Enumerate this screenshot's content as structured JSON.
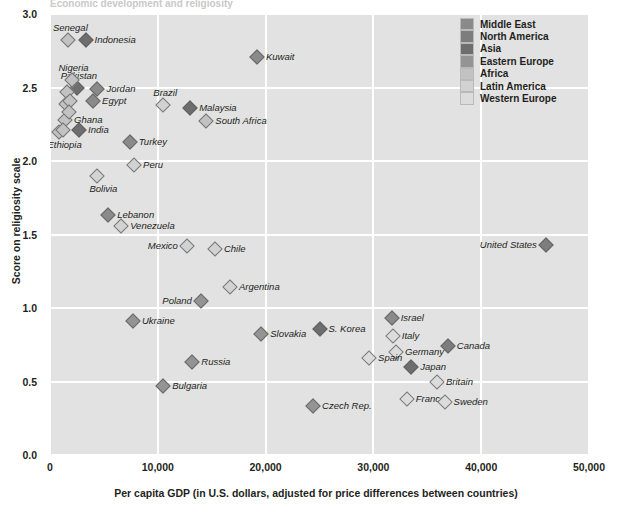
{
  "title": "Economic development and religiosity",
  "axes": {
    "xlabel": "Per capita GDP (in U.S. dollars, adjusted for price differences between countries)",
    "ylabel": "Score on religiosity scale",
    "xticks": [
      "0",
      "10,000",
      "20,000",
      "30,000",
      "40,000",
      "50,000"
    ],
    "yticks": [
      "3.0",
      "2.5",
      "2.0",
      "1.5",
      "1.0",
      "0.5",
      "0.0"
    ]
  },
  "legend": {
    "entries": [
      {
        "label": "Middle East",
        "color": "#8a8a8a"
      },
      {
        "label": "North America",
        "color": "#7d7d7d"
      },
      {
        "label": "Asia",
        "color": "#6e6e6e"
      },
      {
        "label": "Eastern Europe",
        "color": "#949494"
      },
      {
        "label": "Africa",
        "color": "#c2c2c2"
      },
      {
        "label": "Latin America",
        "color": "#d2d2d2"
      },
      {
        "label": "Western Europe",
        "color": "#dcdcdc"
      }
    ]
  },
  "chart_data": {
    "type": "scatter",
    "title": "Economic development and religiosity",
    "xlabel": "Per capita GDP (in U.S. dollars, adjusted for price differences between countries)",
    "ylabel": "Score on religiosity scale",
    "xlim": [
      0,
      50000
    ],
    "ylim": [
      0.0,
      3.0
    ],
    "grid": true,
    "legend_position": "top-right",
    "series": [
      {
        "name": "Middle East",
        "color": "#8a8a8a",
        "points": [
          {
            "label": "Kuwait",
            "x": 19200,
            "y": 2.71,
            "side": "r"
          },
          {
            "label": "Jordan",
            "x": 4400,
            "y": 2.49,
            "side": "r"
          },
          {
            "label": "Egypt",
            "x": 4000,
            "y": 2.41,
            "side": "r"
          },
          {
            "label": "Turkey",
            "x": 7400,
            "y": 2.13,
            "side": "r"
          },
          {
            "label": "Lebanon",
            "x": 5400,
            "y": 1.63,
            "side": "r"
          },
          {
            "label": "Israel",
            "x": 31700,
            "y": 0.93,
            "side": "r"
          }
        ]
      },
      {
        "name": "North America",
        "color": "#7d7d7d",
        "points": [
          {
            "label": "United States",
            "x": 46000,
            "y": 1.43,
            "side": "l"
          },
          {
            "label": "Canada",
            "x": 36900,
            "y": 0.74,
            "side": "r"
          }
        ]
      },
      {
        "name": "Asia",
        "color": "#6e6e6e",
        "points": [
          {
            "label": "Indonesia",
            "x": 3300,
            "y": 2.82,
            "side": "r"
          },
          {
            "label": "Pakistan",
            "x": 2500,
            "y": 2.5,
            "side": "t"
          },
          {
            "label": "India",
            "x": 2700,
            "y": 2.21,
            "side": "r"
          },
          {
            "label": "Malaysia",
            "x": 13000,
            "y": 2.36,
            "side": "r"
          },
          {
            "label": "S. Korea",
            "x": 25000,
            "y": 0.86,
            "side": "r"
          },
          {
            "label": "Japan",
            "x": 33500,
            "y": 0.6,
            "side": "r"
          }
        ]
      },
      {
        "name": "Eastern Europe",
        "color": "#949494",
        "points": [
          {
            "label": "Poland",
            "x": 14000,
            "y": 1.05,
            "side": "l"
          },
          {
            "label": "Ukraine",
            "x": 7700,
            "y": 0.91,
            "side": "r"
          },
          {
            "label": "Slovakia",
            "x": 19600,
            "y": 0.82,
            "side": "r"
          },
          {
            "label": "Russia",
            "x": 13200,
            "y": 0.63,
            "side": "r"
          },
          {
            "label": "Bulgaria",
            "x": 10500,
            "y": 0.47,
            "side": "r"
          },
          {
            "label": "Czech Rep.",
            "x": 24400,
            "y": 0.33,
            "side": "r"
          }
        ]
      },
      {
        "name": "Africa",
        "color": "#c2c2c2",
        "points": [
          {
            "label": "Senegal",
            "x": 1700,
            "y": 2.82,
            "side": "t"
          },
          {
            "label": "Nigeria",
            "x": 2000,
            "y": 2.55,
            "side": "t"
          },
          {
            "label": "Ghana",
            "x": 1400,
            "y": 2.28,
            "side": "r"
          },
          {
            "label": "Ethiopia",
            "x": 800,
            "y": 2.2,
            "side": "b"
          },
          {
            "label": "South Africa",
            "x": 14500,
            "y": 2.27,
            "side": "r"
          },
          {
            "label": "",
            "x": 1600,
            "y": 2.47,
            "side": "n"
          },
          {
            "label": "",
            "x": 1500,
            "y": 2.39,
            "side": "n"
          },
          {
            "label": "",
            "x": 1900,
            "y": 2.41,
            "side": "n"
          },
          {
            "label": "",
            "x": 1800,
            "y": 2.33,
            "side": "n"
          },
          {
            "label": "",
            "x": 1200,
            "y": 2.21,
            "side": "n"
          }
        ]
      },
      {
        "name": "Latin America",
        "color": "#d2d2d2",
        "points": [
          {
            "label": "Brazil",
            "x": 10500,
            "y": 2.38,
            "side": "t"
          },
          {
            "label": "Peru",
            "x": 7800,
            "y": 1.97,
            "side": "r"
          },
          {
            "label": "Bolivia",
            "x": 4400,
            "y": 1.9,
            "side": "b"
          },
          {
            "label": "Venezuela",
            "x": 6600,
            "y": 1.56,
            "side": "r"
          },
          {
            "label": "Mexico",
            "x": 12700,
            "y": 1.42,
            "side": "l"
          },
          {
            "label": "Chile",
            "x": 15300,
            "y": 1.4,
            "side": "r"
          },
          {
            "label": "Argentina",
            "x": 16700,
            "y": 1.14,
            "side": "r"
          }
        ]
      },
      {
        "name": "Western Europe",
        "color": "#dcdcdc",
        "points": [
          {
            "label": "Italy",
            "x": 31800,
            "y": 0.81,
            "side": "r"
          },
          {
            "label": "Germany",
            "x": 32100,
            "y": 0.7,
            "side": "r"
          },
          {
            "label": "Spain",
            "x": 29600,
            "y": 0.66,
            "side": "r"
          },
          {
            "label": "Britain",
            "x": 35900,
            "y": 0.5,
            "side": "r"
          },
          {
            "label": "France",
            "x": 33100,
            "y": 0.38,
            "side": "r"
          },
          {
            "label": "Sweden",
            "x": 36600,
            "y": 0.36,
            "side": "r"
          }
        ]
      }
    ]
  }
}
